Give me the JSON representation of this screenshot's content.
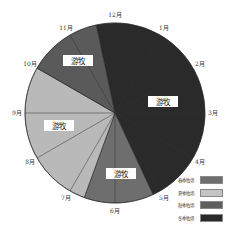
{
  "chart_data": {
    "type": "pie",
    "title": "",
    "month_labels": [
      "12月",
      "1月",
      "2月",
      "3月",
      "4月",
      "5月",
      "6月",
      "7月",
      "8月",
      "9月",
      "10月",
      "11月"
    ],
    "series": [
      {
        "name": "冬季牧场",
        "color": "#2a2a2a",
        "start_deg": 348,
        "end_deg": 515
      },
      {
        "name": "春季牧场",
        "color": "#6e6e6e",
        "start_deg": 155,
        "end_deg": 200
      },
      {
        "name": "夏季牧场",
        "color": "#b9b9b9",
        "start_deg": 200,
        "end_deg": 300
      },
      {
        "name": "秋季牧场",
        "color": "#5a5a5a",
        "start_deg": 300,
        "end_deg": 348
      }
    ],
    "slice_annotations": [
      {
        "text": "游牧",
        "x": 78,
        "y": 61
      },
      {
        "text": "游牧",
        "x": 163,
        "y": 102
      },
      {
        "text": "游牧",
        "x": 59,
        "y": 126
      },
      {
        "text": "游牧",
        "x": 121,
        "y": 174
      }
    ],
    "legend": [
      {
        "label": "春季牧场",
        "color": "#6e6e6e"
      },
      {
        "label": "夏季牧场",
        "color": "#c4c4c4"
      },
      {
        "label": "秋季牧场",
        "color": "#5f5f5f"
      },
      {
        "label": "冬季牧场",
        "color": "#2a2a2a"
      }
    ],
    "legend_position": "bottom-right"
  }
}
